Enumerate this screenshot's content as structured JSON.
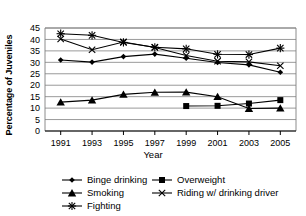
{
  "chart_data": {
    "type": "line",
    "title": "",
    "xlabel": "Year",
    "ylabel": "Percentage of Juveniles",
    "categories": [
      "1991",
      "1993",
      "1995",
      "1997",
      "1999",
      "2001",
      "2003",
      "2005"
    ],
    "x": [
      1991,
      1993,
      1995,
      1997,
      1999,
      2001,
      2003,
      2005
    ],
    "xlim": [
      1990,
      2006
    ],
    "ylim": [
      0,
      45
    ],
    "yticks": [
      0,
      5,
      10,
      15,
      20,
      25,
      30,
      35,
      40,
      45
    ],
    "ytick_labels": [
      "0",
      "5",
      "10",
      "15",
      "20",
      "25",
      "30",
      "35",
      "40",
      "45"
    ],
    "grid": "horizontal",
    "legend_position": "bottom",
    "series": [
      {
        "name": "Binge drinking",
        "marker": "diamond",
        "values": [
          31.0,
          30.1,
          32.5,
          33.6,
          31.8,
          29.9,
          28.9,
          25.7
        ]
      },
      {
        "name": "Smoking",
        "marker": "triangle",
        "values": [
          12.6,
          13.5,
          16.0,
          16.9,
          17.0,
          15.0,
          9.8,
          10.0
        ]
      },
      {
        "name": "Fighting",
        "marker": "star",
        "values": [
          42.5,
          41.8,
          38.7,
          36.6,
          35.9,
          33.5,
          33.4,
          36.2
        ]
      },
      {
        "name": "Overweight",
        "marker": "square",
        "values": [
          null,
          null,
          null,
          null,
          10.9,
          11.0,
          12.0,
          13.5
        ]
      },
      {
        "name": "Riding w/ drinking driver",
        "marker": "x",
        "values": [
          40.2,
          35.5,
          38.9,
          36.5,
          33.0,
          30.5,
          30.2,
          28.5
        ]
      }
    ]
  },
  "legend": {
    "items": [
      {
        "label": "Binge drinking",
        "marker": "diamond"
      },
      {
        "label": "Overweight",
        "marker": "square"
      },
      {
        "label": "Smoking",
        "marker": "triangle"
      },
      {
        "label": "Riding w/ drinking driver",
        "marker": "x"
      },
      {
        "label": "Fighting",
        "marker": "star"
      }
    ]
  },
  "colors": {
    "line": "#000000",
    "grid": "#808080",
    "axis": "#000000",
    "background": "#ffffff"
  }
}
